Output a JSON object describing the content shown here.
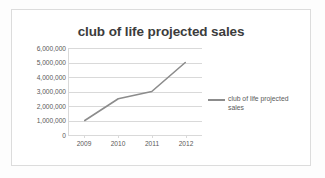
{
  "chart_data": {
    "type": "line",
    "title": "club of life projected sales",
    "categories": [
      "2009",
      "2010",
      "2011",
      "2012"
    ],
    "series": [
      {
        "name": "club of life projected sales",
        "values": [
          1000000,
          2500000,
          3000000,
          5000000
        ],
        "color": "#8c8c8c"
      }
    ],
    "xlabel": "",
    "ylabel": "",
    "ylim": [
      0,
      6000000
    ],
    "ytick_labels": [
      "6,000,000",
      "5,000,000",
      "4,000,000",
      "3,000,000",
      "2,000,000",
      "1,000,000",
      "0"
    ],
    "ytick_values": [
      6000000,
      5000000,
      4000000,
      3000000,
      2000000,
      1000000,
      0
    ],
    "grid": "horizontal",
    "legend_position": "right",
    "legend_entries": [
      "club of life projected sales"
    ]
  },
  "legend": {
    "line1": "club of life projected",
    "line2": "sales"
  },
  "colors": {
    "series": "#8c8c8c",
    "gridline": "#d9d9d9",
    "title_text": "#3c3c3c",
    "tick_text": "#595959",
    "frame_border": "#dcdcdc",
    "background": "#ffffff"
  }
}
